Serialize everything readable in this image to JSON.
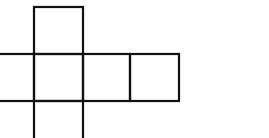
{
  "diagram": {
    "type": "cube-net",
    "stroke_color": "#111111",
    "background_color": "#ffffff",
    "stroke_width": 2.2,
    "faces": [
      {
        "id": "top",
        "x": 34,
        "y": 7,
        "w": 49,
        "h": 47
      },
      {
        "id": "left-cropped",
        "x": -15,
        "y": 54,
        "w": 49,
        "h": 47
      },
      {
        "id": "center",
        "x": 34,
        "y": 54,
        "w": 49,
        "h": 47
      },
      {
        "id": "right-1",
        "x": 83,
        "y": 54,
        "w": 47,
        "h": 47
      },
      {
        "id": "right-2",
        "x": 130,
        "y": 54,
        "w": 49,
        "h": 47
      },
      {
        "id": "bottom-cropped",
        "x": 34,
        "y": 101,
        "w": 49,
        "h": 47
      }
    ]
  }
}
